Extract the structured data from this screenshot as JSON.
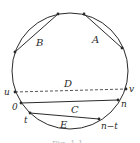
{
  "diagram": {
    "type": "circle-chords",
    "labels": {
      "A": "A",
      "B": "B",
      "C": "C",
      "D": "D",
      "E": "E",
      "u": "u",
      "v": "v",
      "zero": "0",
      "n": "n",
      "t": "t",
      "n_minus_t": "n−t"
    },
    "caption": "Fig. 1.1",
    "colors": {
      "stroke": "#2a2a2a",
      "dashed": "#2a2a2a",
      "background": "#ffffff"
    }
  }
}
